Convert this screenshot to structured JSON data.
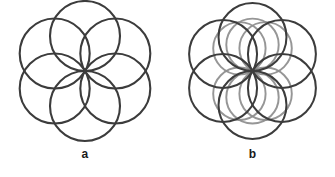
{
  "figure": {
    "background_color": "#ffffff",
    "width": 335,
    "height": 177,
    "caption_a": "a",
    "caption_b": "b",
    "label_color": "#1a1a1a"
  },
  "chart_data": {
    "type": "scatter",
    "title": "",
    "subtitle": "",
    "xlabel": "",
    "ylabel": "",
    "grid": false,
    "legend": "none",
    "panels": [
      {
        "id": "a",
        "label": "a",
        "center": [
          85,
          71
        ],
        "ring_count": 6,
        "series": [
          {
            "name": "dark-rings",
            "color": "#3c3c3c",
            "stroke_width": 2.1,
            "opacity": 1,
            "radius": 35,
            "orbit_radius": 35,
            "start_angle": -90,
            "angle_step": 60,
            "centers": [
              [
                85,
                36
              ],
              [
                115.31,
                53.5
              ],
              [
                115.31,
                88.5
              ],
              [
                85,
                106
              ],
              [
                54.69,
                88.5
              ],
              [
                54.69,
                53.5
              ]
            ]
          }
        ],
        "xlim": [
          15,
          155
        ],
        "ylim": [
          11,
          133
        ]
      },
      {
        "id": "b",
        "label": "b",
        "center": [
          85,
          71
        ],
        "ring_count": 12,
        "series": [
          {
            "name": "dark-rings",
            "color": "#3c3c3c",
            "stroke_width": 2.1,
            "opacity": 1,
            "radius": 35,
            "orbit_radius": 35,
            "start_angle": -90,
            "angle_step": 60,
            "centers": [
              [
                85,
                36
              ],
              [
                115.31,
                53.5
              ],
              [
                115.31,
                88.5
              ],
              [
                85,
                106
              ],
              [
                54.69,
                88.5
              ],
              [
                54.69,
                53.5
              ]
            ]
          },
          {
            "name": "gray-rings",
            "color": "#8d8d8d",
            "stroke_width": 2.0,
            "opacity": 0.92,
            "radius": 27,
            "orbit_radius": 27,
            "start_angle": -60,
            "angle_step": 60,
            "centers": [
              [
                98.5,
                47.62
              ],
              [
                98.5,
                94.38
              ],
              [
                85,
                98
              ],
              [
                71.5,
                94.38
              ],
              [
                71.5,
                47.62
              ],
              [
                85,
                44
              ]
            ]
          }
        ],
        "xlim": [
          15,
          155
        ],
        "ylim": [
          11,
          133
        ]
      }
    ]
  }
}
